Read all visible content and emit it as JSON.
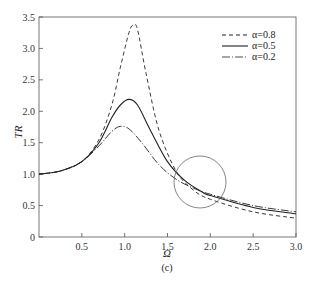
{
  "chart_data": {
    "type": "line",
    "title": "",
    "caption": "(c)",
    "xlabel": "Ω",
    "ylabel": "TR",
    "xlim": [
      0,
      3.0
    ],
    "ylim": [
      0,
      3.5
    ],
    "xticks": [
      "0.5",
      "1.0",
      "1.5",
      "2.0",
      "2.5",
      "3.0"
    ],
    "yticks": [
      "0",
      "0.5",
      "1.0",
      "1.5",
      "2.0",
      "2.5",
      "3.0",
      "3.5"
    ],
    "grid": false,
    "legend_position": "upper right",
    "annotation": "circle around curve crossing near Ω≈1.8, TR≈0.9",
    "series": [
      {
        "name": "α=0.8",
        "style": "dashed",
        "x": [
          0,
          0.25,
          0.5,
          0.7,
          0.85,
          0.95,
          1.05,
          1.1,
          1.15,
          1.25,
          1.4,
          1.6,
          1.8,
          2.0,
          2.5,
          3.0
        ],
        "y": [
          1.0,
          1.05,
          1.2,
          1.55,
          2.1,
          2.7,
          3.25,
          3.37,
          3.3,
          2.6,
          1.7,
          1.05,
          0.75,
          0.6,
          0.4,
          0.3
        ]
      },
      {
        "name": "α=0.5",
        "style": "solid",
        "x": [
          0,
          0.25,
          0.5,
          0.7,
          0.85,
          0.95,
          1.05,
          1.15,
          1.3,
          1.5,
          1.7,
          1.9,
          2.0,
          2.5,
          3.0
        ],
        "y": [
          1.0,
          1.05,
          1.2,
          1.5,
          1.9,
          2.1,
          2.19,
          2.1,
          1.7,
          1.2,
          0.9,
          0.72,
          0.66,
          0.47,
          0.37
        ]
      },
      {
        "name": "α=0.2",
        "style": "dash-dot",
        "x": [
          0,
          0.25,
          0.5,
          0.7,
          0.85,
          0.95,
          1.05,
          1.2,
          1.4,
          1.6,
          1.8,
          2.0,
          2.5,
          3.0
        ],
        "y": [
          1.0,
          1.05,
          1.2,
          1.45,
          1.68,
          1.76,
          1.72,
          1.5,
          1.15,
          0.92,
          0.78,
          0.68,
          0.5,
          0.4
        ]
      }
    ]
  },
  "legend": [
    {
      "label": "α=0.8"
    },
    {
      "label": "α=0.5"
    },
    {
      "label": "α=0.2"
    }
  ]
}
